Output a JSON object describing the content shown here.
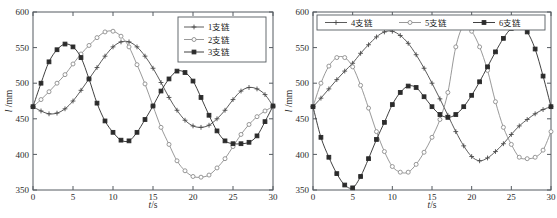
{
  "figure": {
    "panels": [
      {
        "id": "left",
        "legend": [
          "1支链",
          "2支链",
          "3支链"
        ],
        "legend_position": "top-right",
        "legend_orientation": "vertical"
      },
      {
        "id": "right",
        "legend": [
          "4支链",
          "5支链",
          "6支链"
        ],
        "legend_position": "top-center",
        "legend_orientation": "horizontal"
      }
    ],
    "axis": {
      "xlabel_var": "t",
      "xlabel_unit": "/s",
      "ylabel_var": "l",
      "ylabel_unit": "/mm",
      "xticks": [
        "0",
        "5",
        "10",
        "15",
        "20",
        "25",
        "30"
      ],
      "yticks": [
        "350",
        "400",
        "450",
        "500",
        "550",
        "600"
      ]
    },
    "colors": {
      "axis": "#555b60",
      "series1": "#4a4a4a",
      "series2": "#8d8d8d",
      "series3": "#2b2b2b",
      "background": "#ffffff"
    }
  },
  "chart_data": [
    {
      "type": "line",
      "title": "",
      "xlabel": "t/s",
      "ylabel": "l /mm",
      "xlim": [
        0,
        30
      ],
      "ylim": [
        350,
        600
      ],
      "xticks": [
        0,
        5,
        10,
        15,
        20,
        25,
        30
      ],
      "yticks": [
        350,
        400,
        450,
        500,
        550,
        600
      ],
      "grid": false,
      "legend": [
        "1支链",
        "2支链",
        "3支链"
      ],
      "legend_position": "upper right",
      "x": [
        0,
        1,
        2,
        3,
        4,
        5,
        6,
        7,
        8,
        9,
        10,
        11,
        12,
        13,
        14,
        15,
        16,
        17,
        18,
        19,
        20,
        21,
        22,
        23,
        24,
        25,
        26,
        27,
        28,
        29,
        30
      ],
      "series": [
        {
          "name": "1支链",
          "marker": "plus",
          "values": [
            467,
            461,
            457,
            458,
            464,
            475,
            490,
            506,
            522,
            538,
            551,
            558,
            558,
            551,
            538,
            521,
            501,
            480,
            462,
            448,
            440,
            438,
            441,
            450,
            462,
            477,
            489,
            494,
            492,
            484,
            468
          ]
        },
        {
          "name": "2支链",
          "marker": "circle-open",
          "values": [
            467,
            477,
            488,
            500,
            512,
            527,
            541,
            553,
            564,
            572,
            573,
            566,
            551,
            526,
            499,
            468,
            438,
            414,
            391,
            377,
            369,
            368,
            371,
            381,
            394,
            411,
            428,
            442,
            453,
            461,
            467
          ]
        },
        {
          "name": "3支链",
          "marker": "square-filled",
          "values": [
            467,
            500,
            530,
            547,
            555,
            551,
            536,
            506,
            472,
            447,
            431,
            420,
            419,
            431,
            449,
            468,
            489,
            506,
            517,
            515,
            503,
            480,
            455,
            433,
            419,
            415,
            415,
            417,
            426,
            446,
            468
          ]
        }
      ]
    },
    {
      "type": "line",
      "title": "",
      "xlabel": "t/s",
      "ylabel": "l /mm",
      "xlim": [
        0,
        30
      ],
      "ylim": [
        350,
        600
      ],
      "xticks": [
        0,
        5,
        10,
        15,
        20,
        25,
        30
      ],
      "yticks": [
        350,
        400,
        450,
        500,
        550,
        600
      ],
      "grid": false,
      "legend": [
        "4支链",
        "5支链",
        "6支链"
      ],
      "legend_position": "upper center",
      "x": [
        0,
        1,
        2,
        3,
        4,
        5,
        6,
        7,
        8,
        9,
        10,
        11,
        12,
        13,
        14,
        15,
        16,
        17,
        18,
        19,
        20,
        21,
        22,
        23,
        24,
        25,
        26,
        27,
        28,
        29,
        30
      ],
      "series": [
        {
          "name": "4支链",
          "marker": "plus",
          "values": [
            467,
            479,
            492,
            505,
            517,
            528,
            542,
            554,
            565,
            572,
            573,
            567,
            556,
            540,
            521,
            500,
            478,
            455,
            432,
            412,
            397,
            391,
            395,
            404,
            415,
            428,
            440,
            449,
            457,
            463,
            467
          ]
        },
        {
          "name": "5支链",
          "marker": "circle-open",
          "values": [
            467,
            500,
            524,
            536,
            536,
            523,
            497,
            465,
            432,
            404,
            383,
            375,
            375,
            386,
            403,
            424,
            449,
            487,
            551,
            581,
            573,
            551,
            518,
            474,
            438,
            414,
            396,
            394,
            396,
            406,
            432,
            467
          ]
        },
        {
          "name": "6支链",
          "marker": "square-filled",
          "values": [
            467,
            424,
            396,
            373,
            357,
            353,
            369,
            394,
            421,
            445,
            470,
            487,
            496,
            494,
            481,
            467,
            456,
            452,
            456,
            467,
            483,
            502,
            523,
            544,
            563,
            577,
            581,
            572,
            548,
            510,
            467
          ]
        }
      ]
    }
  ]
}
